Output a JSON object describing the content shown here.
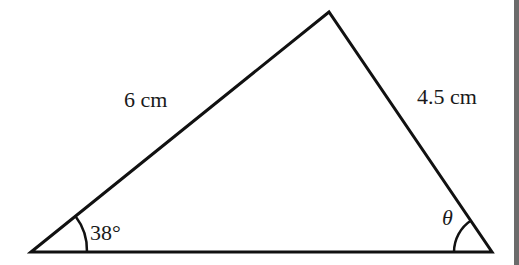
{
  "diagram": {
    "type": "triangle",
    "vertices": {
      "left": {
        "x": 31,
        "y": 252
      },
      "top": {
        "x": 329,
        "y": 12
      },
      "right": {
        "x": 492,
        "y": 252
      }
    },
    "sides": {
      "left_side": {
        "label": "6 cm"
      },
      "right_side": {
        "label": "4.5 cm"
      }
    },
    "angles": {
      "left_angle": {
        "label": "38°"
      },
      "right_angle": {
        "label": "θ"
      }
    },
    "colors": {
      "stroke": "#111111",
      "text": "#1a1a1a",
      "background": "#ffffff",
      "edge_bar": "#6b6b6b"
    }
  }
}
